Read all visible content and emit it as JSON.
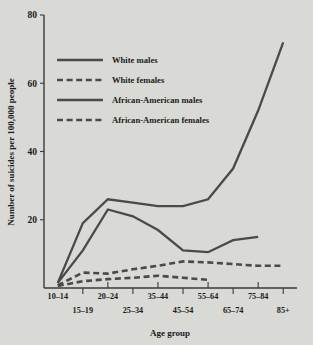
{
  "chart_data": {
    "type": "line",
    "title": "",
    "xlabel": "Age group",
    "ylabel": "Number of suicides per 100,000 people",
    "categories": [
      "10–14",
      "15–19",
      "20–24",
      "25–34",
      "35–44",
      "45–54",
      "55–64",
      "65–74",
      "75–84",
      "85+"
    ],
    "ytick_labels": [
      "80",
      "60",
      "40",
      "20"
    ],
    "ytick_values": [
      80,
      60,
      40,
      20
    ],
    "ylim": [
      0,
      80
    ],
    "grid": false,
    "legend_position": "upper-left",
    "series": [
      {
        "name": "White males",
        "style": "solid",
        "color": "#4a4a4a",
        "values": [
          1.5,
          19,
          26,
          25,
          24,
          24,
          26,
          35,
          52,
          72
        ]
      },
      {
        "name": "White females",
        "style": "dashed",
        "color": "#4a4a4a",
        "values": [
          0.8,
          4.5,
          4.2,
          5.5,
          6.5,
          7.8,
          7.5,
          7.0,
          6.5,
          6.5
        ]
      },
      {
        "name": "African-American males",
        "style": "solid",
        "color": "#4a4a4a",
        "values": [
          1.5,
          11,
          23,
          21,
          17,
          11,
          10.5,
          14,
          15,
          null
        ]
      },
      {
        "name": "African-American females",
        "style": "dashed",
        "color": "#4a4a4a",
        "values": [
          0.6,
          2.0,
          2.6,
          3.0,
          3.6,
          3.0,
          2.4,
          null,
          null,
          null
        ]
      }
    ]
  },
  "legend": {
    "items": [
      {
        "label": "White males",
        "style": "solid"
      },
      {
        "label": "White females",
        "style": "dashed"
      },
      {
        "label": "African-American males",
        "style": "solid"
      },
      {
        "label": "African-American females",
        "style": "dashed"
      }
    ]
  },
  "axes": {
    "x_title": "Age group",
    "y_title": "Number of suicides per 100,000 people"
  },
  "colors": {
    "background": "#d9d9d5",
    "ink": "#4a4a4a",
    "text": "#1b1b1b"
  }
}
